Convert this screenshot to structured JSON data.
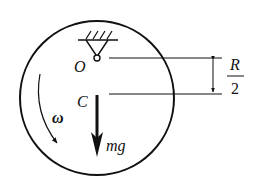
{
  "diagram": {
    "labels": {
      "pivot": "O",
      "center": "C",
      "angular_velocity": "ω",
      "weight": "mg",
      "distance_numerator": "R",
      "distance_denominator": "2"
    },
    "colors": {
      "stroke": "#111111",
      "background": "#ffffff"
    }
  }
}
